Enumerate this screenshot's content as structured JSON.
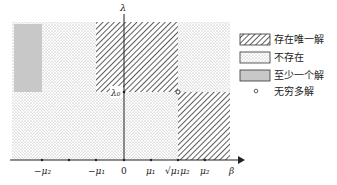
{
  "diagram": {
    "axes": {
      "x_label": "β",
      "y_label": "λ",
      "lambda0_label": "λ₀",
      "ticks": [
        {
          "label": "−μ₂"
        },
        {
          "label": ""
        },
        {
          "label": "−μ₁"
        },
        {
          "label": "0"
        },
        {
          "label": "μ₁"
        },
        {
          "label": "√μ₁μ₂"
        },
        {
          "label": "μ₂"
        }
      ]
    },
    "legend": [
      {
        "label": "存在唯一解",
        "pattern": "hatch"
      },
      {
        "label": "不存在",
        "pattern": "dots"
      },
      {
        "label": "至少一个解",
        "pattern": "gray-fill",
        "color": "#c8c8c8"
      },
      {
        "label": "无穷多解",
        "pattern": "circle"
      }
    ]
  }
}
